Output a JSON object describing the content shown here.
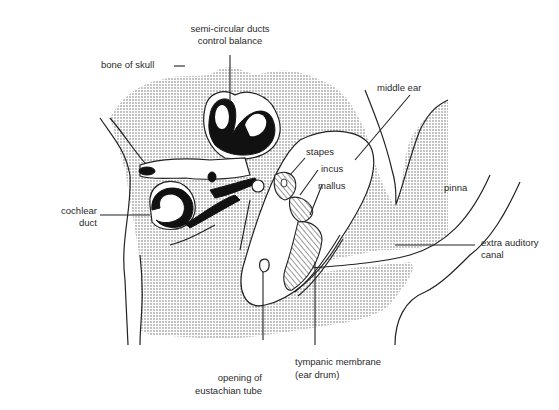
{
  "diagram": {
    "labels": {
      "semicircular_line1": "semi-circular ducts",
      "semicircular_line2": "control balance",
      "bone_of_skull": "bone of skull",
      "middle_ear": "middle ear",
      "stapes": "stapes",
      "incus": "incus",
      "mallus": "mallus",
      "pinna": "pinna",
      "cochlear_line1": "cochlear",
      "cochlear_line2": "duct",
      "extra_auditory_line1": "extra auditory",
      "extra_auditory_line2": "canal",
      "eustachian_line1": "opening of",
      "eustachian_line2": "eustachian tube",
      "tympanic_line1": "tympanic membrane",
      "tympanic_line2": "(ear drum)"
    },
    "colors": {
      "ink": "#222222",
      "background": "#ffffff",
      "stipple": "#555555"
    }
  }
}
